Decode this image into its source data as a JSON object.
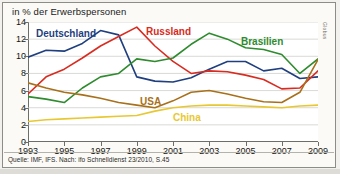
{
  "chart_data": {
    "type": "line",
    "title": "in % der Erwerbspersonen",
    "xlabel": "",
    "ylabel": "",
    "xlim": [
      1993,
      2009
    ],
    "ylim": [
      0,
      14
    ],
    "ytick_labels": [
      "0",
      "2",
      "4",
      "6",
      "8",
      "10",
      "12",
      "14"
    ],
    "ytick_values": [
      0,
      2,
      4,
      6,
      8,
      10,
      12,
      14
    ],
    "xtick_labels": [
      "1993",
      "1995",
      "1997",
      "1999",
      "2001",
      "2003",
      "2005",
      "2007",
      "2009"
    ],
    "xtick_values": [
      1993,
      1995,
      1997,
      1999,
      2001,
      2003,
      2005,
      2007,
      2009
    ],
    "grid": true,
    "legend": "inline-annotations",
    "x": [
      1993,
      1994,
      1995,
      1996,
      1997,
      1998,
      1999,
      2000,
      2001,
      2002,
      2003,
      2004,
      2005,
      2006,
      2007,
      2008,
      2009
    ],
    "series": [
      {
        "name": "Deutschland",
        "color": "#1f3f7f",
        "values": [
          9.9,
          10.7,
          10.6,
          11.5,
          13.0,
          12.5,
          7.6,
          7.1,
          7.0,
          7.5,
          8.5,
          9.4,
          9.4,
          8.3,
          8.6,
          7.4,
          7.6
        ]
      },
      {
        "name": "Russland",
        "color": "#d92b20",
        "values": [
          5.6,
          7.6,
          8.5,
          9.8,
          11.2,
          12.3,
          13.4,
          11.2,
          9.4,
          8.0,
          8.3,
          8.2,
          7.8,
          7.3,
          6.2,
          6.3,
          8.3
        ]
      },
      {
        "name": "Brasilien",
        "color": "#2e8b2e",
        "values": [
          5.3,
          5.0,
          4.6,
          6.3,
          7.6,
          8.0,
          9.7,
          9.4,
          9.8,
          11.4,
          12.7,
          12.0,
          11.0,
          10.8,
          10.2,
          8.0,
          9.7
        ]
      },
      {
        "name": "USA",
        "color": "#a8701a",
        "values": [
          6.9,
          6.3,
          5.8,
          5.5,
          5.1,
          4.6,
          4.3,
          4.0,
          4.8,
          5.8,
          6.0,
          5.6,
          5.1,
          4.7,
          4.6,
          5.8,
          9.6
        ]
      },
      {
        "name": "China",
        "color": "#e8c832",
        "values": [
          2.4,
          2.6,
          2.7,
          2.8,
          2.9,
          3.0,
          3.1,
          3.6,
          4.0,
          4.2,
          4.3,
          4.3,
          4.2,
          4.1,
          4.0,
          4.2,
          4.3
        ]
      }
    ],
    "annotations": [
      {
        "text": "Deutschland",
        "color": "#1f3f7f",
        "left": 36,
        "top": 28
      },
      {
        "text": "Russland",
        "color": "#d92b20",
        "left": 146,
        "top": 26
      },
      {
        "text": "Brasilien",
        "color": "#2e8b2e",
        "left": 241,
        "top": 36
      },
      {
        "text": "USA",
        "color": "#a8701a",
        "left": 140,
        "top": 96
      },
      {
        "text": "China",
        "color": "#e8c832",
        "left": 173,
        "top": 112
      }
    ]
  },
  "footer": {
    "source": "Quelle: IMF, IFS. Nach: ifo Schnelldienst 23/2010, S.45"
  },
  "edge_credit": "Globus",
  "colors": {
    "plot_background": "#ffffff",
    "figure_background": "#f2f1ee",
    "grid": "#c9c9c4",
    "axis": "#6e6e68",
    "text": "#16160f"
  }
}
